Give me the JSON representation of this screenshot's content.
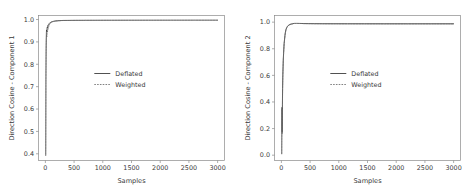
{
  "figure": {
    "background": "#ffffff",
    "panel_count": 2
  },
  "chart_data": [
    {
      "type": "line",
      "title": "",
      "xlabel": "Samples",
      "ylabel": "Direction Cosine - Component 1",
      "xlim": [
        -120,
        3120
      ],
      "ylim": [
        0.37,
        1.018
      ],
      "xticks": [
        0,
        500,
        1000,
        1500,
        2000,
        2500,
        3000
      ],
      "xticklabels": [
        "0",
        "500",
        "1000",
        "1500",
        "2000",
        "2500",
        "3000"
      ],
      "yticks": [
        0.4,
        0.5,
        0.6,
        0.7,
        0.8,
        0.9,
        1.0
      ],
      "yticklabels": [
        "0.4",
        "0.5",
        "0.6",
        "0.7",
        "0.8",
        "0.9",
        "1.0"
      ],
      "grid": false,
      "legend": {
        "position": "center",
        "entries": [
          {
            "label": "Deflated",
            "style": "solid",
            "color": "#3d3d3d"
          },
          {
            "label": "Weighted",
            "style": "dashed",
            "color": "#6a6a6a"
          }
        ]
      },
      "series": [
        {
          "name": "Deflated",
          "style": "solid",
          "color": "#3d3d3d",
          "x": [
            5,
            8,
            11,
            14,
            17,
            20,
            24,
            28,
            32,
            36,
            40,
            45,
            50,
            56,
            62,
            68,
            75,
            82,
            90,
            100,
            110,
            125,
            140,
            160,
            185,
            210,
            240,
            275,
            320,
            380,
            450,
            550,
            700,
            900,
            1150,
            1450,
            1800,
            2200,
            2600,
            3000
          ],
          "y": [
            0.392,
            0.74,
            0.86,
            0.915,
            0.941,
            0.953,
            0.947,
            0.958,
            0.965,
            0.962,
            0.97,
            0.975,
            0.974,
            0.978,
            0.981,
            0.983,
            0.984,
            0.986,
            0.987,
            0.989,
            0.99,
            0.991,
            0.992,
            0.993,
            0.994,
            0.9945,
            0.995,
            0.9955,
            0.996,
            0.9962,
            0.9965,
            0.9968,
            0.997,
            0.9972,
            0.9974,
            0.9975,
            0.9976,
            0.9977,
            0.9978,
            0.9978
          ]
        },
        {
          "name": "Weighted",
          "style": "dashed",
          "color": "#6a6a6a",
          "x": [
            5,
            8,
            11,
            14,
            17,
            20,
            24,
            28,
            32,
            36,
            40,
            45,
            50,
            56,
            62,
            68,
            75,
            82,
            90,
            100,
            110,
            125,
            140,
            160,
            185,
            210,
            240,
            275,
            320,
            380,
            450,
            550,
            700,
            900,
            1150,
            1450,
            1800,
            2200,
            2600,
            3000
          ],
          "y": [
            0.398,
            0.71,
            0.83,
            0.888,
            0.912,
            0.93,
            0.922,
            0.936,
            0.946,
            0.944,
            0.952,
            0.958,
            0.961,
            0.967,
            0.972,
            0.976,
            0.979,
            0.982,
            0.984,
            0.986,
            0.988,
            0.99,
            0.991,
            0.992,
            0.9932,
            0.994,
            0.9948,
            0.9952,
            0.9958,
            0.996,
            0.9963,
            0.9966,
            0.9969,
            0.9971,
            0.9973,
            0.9974,
            0.9975,
            0.9976,
            0.9977,
            0.9977
          ]
        }
      ]
    },
    {
      "type": "line",
      "title": "",
      "xlabel": "Samples",
      "ylabel": "Direction Cosine - Component 2",
      "xlim": [
        -120,
        3120
      ],
      "ylim": [
        -0.04,
        1.05
      ],
      "xticks": [
        0,
        500,
        1000,
        1500,
        2000,
        2500,
        3000
      ],
      "xticklabels": [
        "0",
        "500",
        "1000",
        "1500",
        "2000",
        "2500",
        "3000"
      ],
      "yticks": [
        0.0,
        0.2,
        0.4,
        0.6,
        0.8,
        1.0
      ],
      "yticklabels": [
        "0.0",
        "0.2",
        "0.4",
        "0.6",
        "0.8",
        "1.0"
      ],
      "grid": false,
      "legend": {
        "position": "center",
        "entries": [
          {
            "label": "Deflated",
            "style": "solid",
            "color": "#3d3d3d"
          },
          {
            "label": "Weighted",
            "style": "dashed",
            "color": "#6a6a6a"
          }
        ]
      },
      "series": [
        {
          "name": "Deflated",
          "style": "solid",
          "color": "#3d3d3d",
          "x": [
            5,
            7,
            9,
            11,
            13,
            15,
            18,
            21,
            25,
            29,
            33,
            38,
            43,
            48,
            55,
            62,
            70,
            80,
            92,
            105,
            120,
            140,
            165,
            195,
            230,
            270,
            320,
            390,
            470,
            580,
            720,
            900,
            1150,
            1450,
            1800,
            2200,
            2600,
            3000
          ],
          "y": [
            0.008,
            0.205,
            0.36,
            0.3,
            0.175,
            0.255,
            0.38,
            0.5,
            0.6,
            0.66,
            0.715,
            0.765,
            0.805,
            0.84,
            0.872,
            0.9,
            0.925,
            0.945,
            0.958,
            0.968,
            0.975,
            0.981,
            0.985,
            0.988,
            0.992,
            0.9925,
            0.991,
            0.9895,
            0.989,
            0.9885,
            0.9882,
            0.988,
            0.9878,
            0.9877,
            0.9876,
            0.9876,
            0.9875,
            0.9875
          ]
        },
        {
          "name": "Weighted",
          "style": "dashed",
          "color": "#6a6a6a",
          "x": [
            5,
            7,
            9,
            11,
            13,
            15,
            18,
            21,
            25,
            29,
            33,
            38,
            43,
            48,
            55,
            62,
            70,
            80,
            92,
            105,
            120,
            140,
            165,
            195,
            230,
            270,
            320,
            390,
            470,
            580,
            720,
            900,
            1150,
            1450,
            1800,
            2200,
            2600,
            3000
          ],
          "y": [
            0.012,
            0.19,
            0.345,
            0.285,
            0.16,
            0.24,
            0.365,
            0.485,
            0.585,
            0.648,
            0.705,
            0.757,
            0.798,
            0.834,
            0.867,
            0.896,
            0.921,
            0.942,
            0.956,
            0.966,
            0.974,
            0.98,
            0.9845,
            0.9875,
            0.9915,
            0.992,
            0.9905,
            0.989,
            0.9886,
            0.9882,
            0.988,
            0.9878,
            0.9876,
            0.9875,
            0.9874,
            0.9874,
            0.9873,
            0.9873
          ]
        }
      ]
    }
  ]
}
